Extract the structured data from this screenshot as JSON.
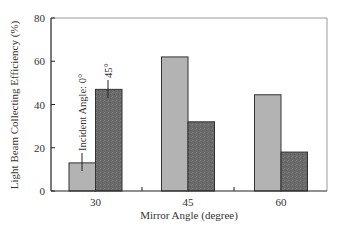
{
  "chart_data": {
    "type": "bar",
    "title": "",
    "xlabel": "Mirror Angle (degree)",
    "ylabel": "Light Beam Collecting Efficiency (%)",
    "categories": [
      "30",
      "45",
      "60"
    ],
    "series": [
      {
        "name": "Incident Angle: 0°",
        "values": [
          13,
          62,
          44.5
        ],
        "color": "#b3b3b3"
      },
      {
        "name": "45°",
        "values": [
          47,
          32,
          18
        ],
        "color": "#6e6e6e"
      }
    ],
    "ylim": [
      0,
      80
    ],
    "yticks": [
      "0",
      "20",
      "40",
      "60",
      "80"
    ],
    "grid": false,
    "legend": "inline annotations on first bar group",
    "annotations": [
      "Incident Angle: 0°",
      "45°"
    ]
  }
}
